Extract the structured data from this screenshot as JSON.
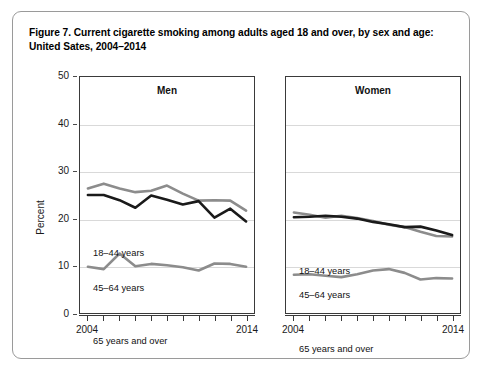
{
  "figure": {
    "title": "Figure 7. Current cigarette smoking among adults aged 18 and over, by sex and age: United Sates, 2004–2014",
    "border_color": "#9a9a9a"
  },
  "axes": {
    "y_axis_title": "Percent",
    "y_ticks": [
      "50",
      "40",
      "30",
      "20",
      "10",
      "0"
    ],
    "x_start_label": "2004",
    "x_end_label": "2014",
    "x_tick_count": 11
  },
  "panels": {
    "men_title": "Men",
    "women_title": "Women"
  },
  "series_labels": {
    "men_18_44": "18–44 years",
    "men_45_64": "45–64 years",
    "men_65_over": "65 years and over",
    "women_18_44": "18–44 years",
    "women_45_64": "45–64 years",
    "women_65_over": "65 years and over"
  },
  "colors": {
    "gray_series": "#8c8c8c",
    "black_series": "#1a1a1a",
    "gridline": "#d9d9d9",
    "panel_frame": "#3a3a3a"
  },
  "chart_data": {
    "type": "line",
    "title": "Figure 7. Current cigarette smoking among adults aged 18 and over, by sex and age: United Sates, 2004–2014",
    "xlabel": "",
    "ylabel": "Percent",
    "xlim": [
      2004,
      2014
    ],
    "ylim": [
      0,
      50
    ],
    "yticks": [
      0,
      10,
      20,
      30,
      40,
      50
    ],
    "grid": "horizontal",
    "legend": "inline-labels",
    "x": [
      2004,
      2005,
      2006,
      2007,
      2008,
      2009,
      2010,
      2011,
      2012,
      2013,
      2014
    ],
    "panels": [
      {
        "name": "Men",
        "series": [
          {
            "name": "18–44 years",
            "color": "#8c8c8c",
            "values": [
              26.4,
              27.4,
              26.4,
              25.6,
              25.9,
              27.0,
              25.3,
              23.8,
              23.9,
              23.8,
              21.7
            ]
          },
          {
            "name": "45–64 years",
            "color": "#1a1a1a",
            "values": [
              25.0,
              25.0,
              23.9,
              22.3,
              24.9,
              24.0,
              23.0,
              23.7,
              20.2,
              22.1,
              19.4
            ]
          },
          {
            "name": "65 years and over",
            "color": "#8c8c8c",
            "values": [
              9.8,
              9.3,
              12.6,
              9.9,
              10.4,
              10.1,
              9.7,
              9.0,
              10.5,
              10.4,
              9.8
            ]
          }
        ]
      },
      {
        "name": "Women",
        "series": [
          {
            "name": "18–44 years",
            "color": "#8c8c8c",
            "values": [
              21.3,
              20.8,
              20.2,
              20.6,
              20.1,
              19.5,
              18.7,
              18.2,
              17.2,
              16.3,
              16.2
            ]
          },
          {
            "name": "45–64 years",
            "color": "#1a1a1a",
            "values": [
              20.3,
              20.4,
              20.6,
              20.4,
              20.0,
              19.3,
              18.8,
              18.2,
              18.3,
              17.5,
              16.5
            ]
          },
          {
            "name": "65 years and over",
            "color": "#8c8c8c",
            "values": [
              8.1,
              8.2,
              7.9,
              7.6,
              8.2,
              9.0,
              9.3,
              8.5,
              7.1,
              7.4,
              7.3
            ]
          }
        ]
      }
    ]
  }
}
